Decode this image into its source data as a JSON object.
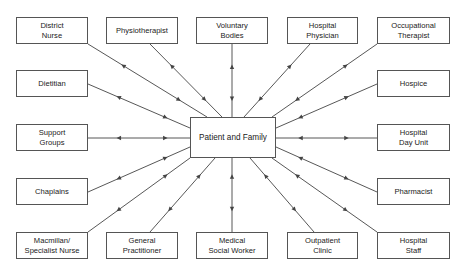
{
  "diagram": {
    "type": "hub-and-spoke",
    "center": {
      "id": "patient",
      "label": "Patient and Family"
    },
    "nodes": [
      {
        "id": "district-nurse",
        "label": "District\nNurse"
      },
      {
        "id": "physiotherapist",
        "label": "Physiotherapist"
      },
      {
        "id": "voluntary-bodies",
        "label": "Voluntary\nBodies"
      },
      {
        "id": "hospital-physician",
        "label": "Hospital\nPhysician"
      },
      {
        "id": "occupational-therapist",
        "label": "Occupational\nTherapist"
      },
      {
        "id": "dietitian",
        "label": "Dietitian"
      },
      {
        "id": "hospice",
        "label": "Hospice"
      },
      {
        "id": "support-groups",
        "label": "Support\nGroups"
      },
      {
        "id": "hospital-day-unit",
        "label": "Hospital\nDay Unit"
      },
      {
        "id": "chaplains",
        "label": "Chaplains"
      },
      {
        "id": "pharmacist",
        "label": "Pharmacist"
      },
      {
        "id": "macmillan-specialist-nurse",
        "label": "Macmillan/\nSpecialist Nurse"
      },
      {
        "id": "general-practitioner",
        "label": "General\nPractitioner"
      },
      {
        "id": "medical-social-worker",
        "label": "Medical\nSocial Worker"
      },
      {
        "id": "outpatient-clinic",
        "label": "Outpatient\nClinic"
      },
      {
        "id": "hospital-staff",
        "label": "Hospital\nStaff"
      }
    ],
    "edges_bidirectional": true,
    "colors": {
      "line": "#444444",
      "border": "#555555",
      "text": "#222222"
    }
  }
}
